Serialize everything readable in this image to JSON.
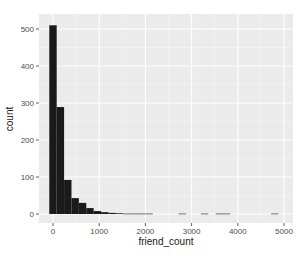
{
  "chart_data": {
    "type": "bar",
    "title": "",
    "xlabel": "friend_count",
    "ylabel": "count",
    "xlim": [
      -150,
      5200
    ],
    "ylim": [
      -25,
      530
    ],
    "x_ticks": [
      0,
      1000,
      2000,
      3000,
      4000,
      5000
    ],
    "x_tick_labels": [
      "0",
      "1000",
      "2000",
      "3000",
      "4000",
      "5000"
    ],
    "y_ticks": [
      0,
      100,
      200,
      300,
      400,
      500
    ],
    "y_tick_labels": [
      "0",
      "100",
      "200",
      "300",
      "400",
      "500"
    ],
    "grid": true,
    "legend": "none",
    "bin_width": 160,
    "bins": [
      {
        "x_start": -80,
        "count": 510
      },
      {
        "x_start": 80,
        "count": 289
      },
      {
        "x_start": 240,
        "count": 92
      },
      {
        "x_start": 400,
        "count": 43
      },
      {
        "x_start": 560,
        "count": 30
      },
      {
        "x_start": 720,
        "count": 16
      },
      {
        "x_start": 880,
        "count": 8
      },
      {
        "x_start": 1040,
        "count": 5
      },
      {
        "x_start": 1200,
        "count": 3
      },
      {
        "x_start": 1360,
        "count": 2
      },
      {
        "x_start": 1520,
        "count": 1
      },
      {
        "x_start": 1680,
        "count": 1
      },
      {
        "x_start": 1840,
        "count": 1
      },
      {
        "x_start": 2000,
        "count": 1
      },
      {
        "x_start": 2720,
        "count": 1
      },
      {
        "x_start": 3200,
        "count": 1
      },
      {
        "x_start": 3520,
        "count": 1
      },
      {
        "x_start": 3680,
        "count": 1
      },
      {
        "x_start": 4720,
        "count": 1
      }
    ],
    "colors": {
      "bar_fill": "#1a1a1a",
      "panel_background": "#ebebeb",
      "grid_major": "#ffffff",
      "grid_minor": "#f5f5f5"
    }
  }
}
